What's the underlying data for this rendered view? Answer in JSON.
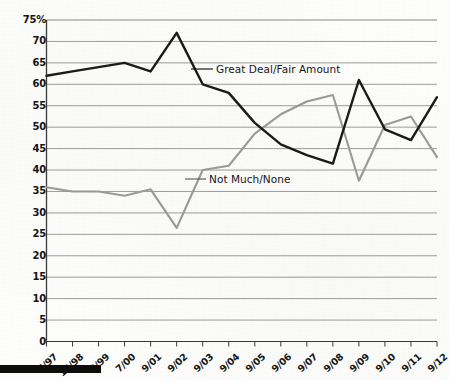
{
  "chart_data": {
    "type": "line",
    "title": "",
    "subtitle": "",
    "xlabel": "",
    "ylabel": "",
    "ylim": [
      0,
      75
    ],
    "ytick_labels": [
      "75%",
      "70",
      "65",
      "60",
      "55",
      "50",
      "45",
      "40",
      "35",
      "30",
      "25",
      "20",
      "15",
      "10",
      "5",
      "0"
    ],
    "ytick_values": [
      75,
      70,
      65,
      60,
      55,
      50,
      45,
      40,
      35,
      30,
      25,
      20,
      15,
      10,
      5,
      0
    ],
    "grid": true,
    "legend_position": "inline-annotation",
    "categories": [
      "6/97",
      "12/98",
      "2/99",
      "7/00",
      "9/01",
      "9/02",
      "9/03",
      "9/04",
      "9/05",
      "9/06",
      "9/07",
      "9/08",
      "9/09",
      "9/10",
      "9/11",
      "9/12"
    ],
    "series": [
      {
        "name": "Great Deal/Fair Amount",
        "color": "#1a1a1a",
        "values": [
          62,
          63,
          64,
          65,
          63,
          72,
          60,
          58,
          51,
          46,
          43.5,
          41.5,
          61,
          49.5,
          47,
          57
        ]
      },
      {
        "name": "Not Much/None",
        "color": "#9a9a9a",
        "values": [
          36,
          35,
          35,
          34,
          35.5,
          26.5,
          40,
          41,
          48.5,
          53,
          56,
          57.5,
          37.5,
          50.5,
          52.5,
          43
        ]
      }
    ],
    "annotations": [
      {
        "text": "Great Deal/Fair Amount",
        "series": "Great Deal/Fair Amount"
      },
      {
        "text": "Not Much/None",
        "series": "Not Much/None"
      }
    ]
  },
  "axis": {
    "y_labels": [
      "75%",
      "70",
      "65",
      "60",
      "55",
      "50",
      "45",
      "40",
      "35",
      "30",
      "25",
      "20",
      "15",
      "10",
      "5",
      "0"
    ],
    "x_labels": [
      "6/97",
      "12/98",
      "2/99",
      "7/00",
      "9/01",
      "9/02",
      "9/03",
      "9/04",
      "9/05",
      "9/06",
      "9/07",
      "9/08",
      "9/09",
      "9/10",
      "9/11",
      "9/12"
    ]
  },
  "labels": {
    "series_black": "Great Deal/Fair Amount",
    "series_gray": "Not Much/None"
  },
  "colors": {
    "series_black": "#1a1a1a",
    "series_gray": "#9a9a9a",
    "grid": "#8a8a8a",
    "axis": "#4a4a4a",
    "text": "#141414",
    "footer_bar": "#0d0d0d"
  }
}
